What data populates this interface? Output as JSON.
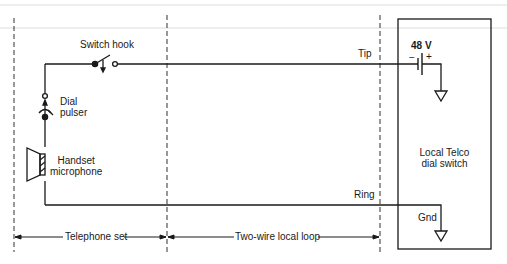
{
  "diagram": {
    "labels": {
      "switch_hook": "Switch hook",
      "tip": "Tip",
      "ring": "Ring",
      "voltage": "48 V",
      "minus": "−",
      "plus": "+",
      "dial_pulser_1": "Dial",
      "dial_pulser_2": "pulser",
      "handset_1": "Handset",
      "handset_2": "microphone",
      "telco_1": "Local Telco",
      "telco_2": "dial switch",
      "gnd": "Gnd"
    },
    "regions": {
      "telephone_set": "Telephone set",
      "local_loop": "Two-wire local loop"
    },
    "colors": {
      "line": "#1a1a1a",
      "background": "#ffffff"
    }
  }
}
